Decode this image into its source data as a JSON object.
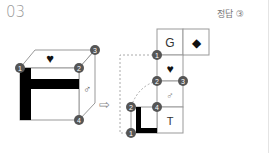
{
  "problem": {
    "number": "03",
    "answer_label": "정답 ③"
  },
  "cube": {
    "top_face_symbol": "♥",
    "right_face_symbol": "♂",
    "front_face_pattern": "thick-black-bar-shape",
    "vertices": [
      "1",
      "2",
      "3",
      "4"
    ]
  },
  "arrow": "⇨",
  "net": {
    "cells": [
      {
        "label": "G"
      },
      {
        "label": "◆"
      },
      {
        "label": "♥"
      },
      {
        "label": "♂"
      },
      {
        "label": "T"
      },
      {
        "label": ""
      }
    ],
    "vertices": [
      "1",
      "2",
      "3",
      "2",
      "4",
      "1"
    ]
  },
  "colors": {
    "circle_fill": "#555555",
    "circle_text": "#ffffff",
    "line": "#999999",
    "black_bar": "#000000"
  }
}
